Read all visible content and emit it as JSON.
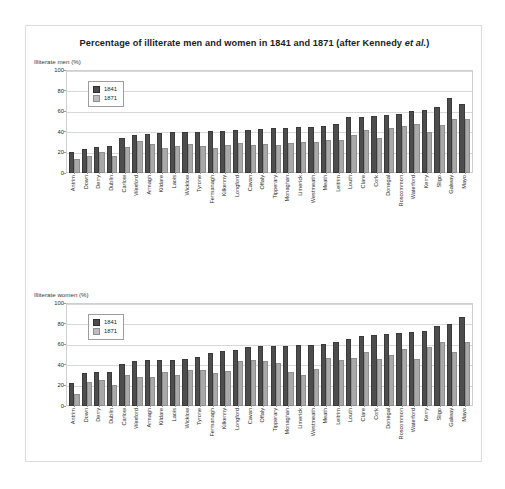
{
  "figure": {
    "title_prefix": "Percentage of illiterate men and women in 1841 and 1871 (after Kennedy ",
    "title_italic": "et al.",
    "title_suffix": ")",
    "colors": {
      "series_1841": "#4d4d4d",
      "series_1871": "#a9a9a9",
      "panel_border": "#dcdcdc",
      "grid": "#d8d8d8"
    }
  },
  "legend": {
    "item_1841": "1841",
    "item_1871": "1871"
  },
  "panels": {
    "men_caption": "Illiterate men (%)",
    "women_caption": "Illiterate women (%)"
  },
  "chart_data": [
    {
      "type": "bar",
      "title": "Illiterate men (%)",
      "xlabel": "",
      "ylabel": "Illiterate men (%)",
      "ylim": [
        0,
        100
      ],
      "yticks": [
        0,
        20,
        40,
        60,
        80,
        100
      ],
      "grid": true,
      "legend_position": "top-left",
      "categories": [
        "Antrim",
        "Down",
        "Derry",
        "Dublin",
        "Carlow",
        "Wexford",
        "Armagh",
        "Kildare",
        "Laois",
        "Wicklow",
        "Tyrone",
        "Fermanagh",
        "Kilkenny",
        "Longford",
        "Cavan",
        "Offaly",
        "Tipperary",
        "Monaghan",
        "Limerick",
        "Westmeath",
        "Meath",
        "Leitrim",
        "Louth",
        "Clare",
        "Cork",
        "Donegal",
        "Roscommon",
        "Waterford",
        "Kerry",
        "Sligo",
        "Galway",
        "Mayo"
      ],
      "series": [
        {
          "name": "1841",
          "values": [
            20,
            23,
            25,
            26,
            34,
            37,
            38,
            39,
            40,
            40,
            40,
            41,
            41,
            42,
            42,
            43,
            44,
            44,
            45,
            45,
            46,
            48,
            54,
            54,
            55,
            56,
            57,
            60,
            61,
            64,
            73,
            67
          ]
        },
        {
          "name": "1871",
          "values": [
            14,
            17,
            20,
            17,
            25,
            31,
            28,
            24,
            26,
            28,
            26,
            24,
            27,
            29,
            27,
            28,
            27,
            29,
            30,
            30,
            32,
            32,
            37,
            42,
            34,
            44,
            46,
            48,
            40,
            47,
            52,
            52
          ]
        }
      ]
    },
    {
      "type": "bar",
      "title": "Illiterate women (%)",
      "xlabel": "",
      "ylabel": "Illiterate women (%)",
      "ylim": [
        0,
        100
      ],
      "yticks": [
        0,
        20,
        40,
        60,
        80,
        100
      ],
      "grid": true,
      "legend_position": "top-left",
      "categories": [
        "Antrim",
        "Down",
        "Derry",
        "Dublin",
        "Carlow",
        "Wexford",
        "Armagh",
        "Kildare",
        "Laois",
        "Wicklow",
        "Tyrone",
        "Fermanagh",
        "Kilkenny",
        "Longford",
        "Cavan",
        "Offaly",
        "Tipperary",
        "Monaghan",
        "Limerick",
        "Westmeath",
        "Meath",
        "Leitrim",
        "Louth",
        "Clare",
        "Cork",
        "Donegal",
        "Roscommon",
        "Waterford",
        "Kerry",
        "Sligo",
        "Galway",
        "Mayo"
      ],
      "series": [
        {
          "name": "1841",
          "values": [
            22,
            32,
            33,
            33,
            41,
            44,
            45,
            45,
            45,
            46,
            48,
            51,
            53,
            54,
            57,
            58,
            58,
            58,
            59,
            59,
            60,
            62,
            65,
            68,
            69,
            70,
            71,
            72,
            73,
            78,
            80,
            86
          ]
        },
        {
          "name": "1871",
          "values": [
            12,
            23,
            25,
            20,
            30,
            28,
            28,
            33,
            30,
            35,
            35,
            32,
            34,
            44,
            45,
            44,
            42,
            33,
            30,
            36,
            47,
            45,
            47,
            52,
            46,
            50,
            55,
            46,
            57,
            62,
            52,
            62
          ]
        }
      ]
    }
  ]
}
